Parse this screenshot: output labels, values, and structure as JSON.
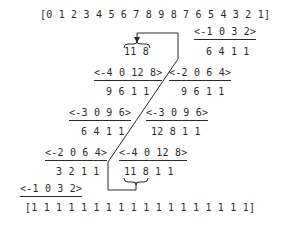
{
  "top_sequence": "[0 1 2 3 4 5 6 7 8 9 8 7 6 5 4 3 2 1]",
  "bottom_sequence": "[1 1 1 1 1 1 1 1 1 1 1 1 1 1 1 1 1 1]",
  "right_column": [
    {
      "vector": "<-1 0 3 2>",
      "values": "6 4 1 1"
    },
    {
      "vector": "<-2 0 6 4>",
      "values": "9 6 1 1"
    },
    {
      "vector": "<-3 0 9 6>",
      "values": "12 8 1 1"
    },
    {
      "vector": "<-4 0 12 8>",
      "values": "11 8 1 1"
    }
  ],
  "left_column": [
    {
      "vector": "<-4 0 12 8>",
      "values": "9 6 1 1"
    },
    {
      "vector": "<-3 0 9 6>",
      "values": "6 4 1 1"
    },
    {
      "vector": "<-2 0 6 4>",
      "values": "3 2 1 1"
    },
    {
      "vector": "<-1 0 3 2>"
    }
  ],
  "braced_top": "11 8",
  "braced_bottom_highlight": "11 8"
}
